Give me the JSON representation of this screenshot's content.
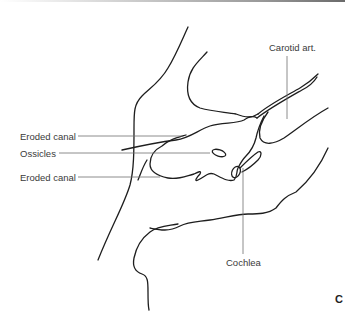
{
  "figure": {
    "panel_letter": "C",
    "labels": {
      "carotid": "Carotid art.",
      "eroded_canal_top": "Eroded canal",
      "ossicles": "Ossicles",
      "eroded_canal_bottom": "Eroded canal",
      "cochlea": "Cochlea"
    },
    "colors": {
      "outline": "#1e1e1e",
      "leader": "#6e6e6e",
      "text": "#3a3a3a",
      "background": "#ffffff"
    }
  }
}
